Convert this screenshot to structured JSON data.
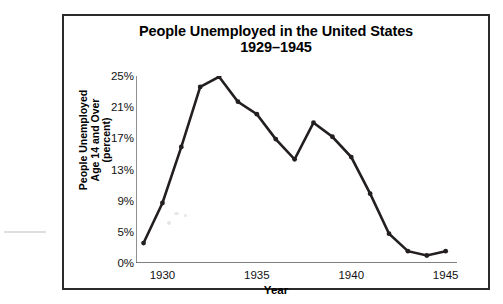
{
  "figure": {
    "title_line1": "People Unemployed in the United States",
    "title_line2": "1929–1945"
  },
  "axes": {
    "y_axis_title": "People Unemployed\nAge 14 and Over\n(percent)",
    "y_axis_title_line1": "People Unemployed",
    "y_axis_title_line2": "Age 14 and Over",
    "y_axis_title_line3": "(percent)",
    "x_axis_title": "Year",
    "y_tick_labels": [
      "25%",
      "21%",
      "17%",
      "13%",
      "9%",
      "5%",
      "0%"
    ],
    "x_tick_labels": [
      "1930",
      "1935",
      "1940",
      "1945"
    ]
  },
  "colors": {
    "line": "#231f20",
    "frame": "#2b2b2b",
    "axis": "#555555",
    "background": "#ffffff"
  },
  "chart_data": {
    "type": "line",
    "title": "People Unemployed in the United States 1929–1945",
    "xlabel": "Year",
    "ylabel": "People Unemployed Age 14 and Over (percent)",
    "x": [
      1929,
      1930,
      1931,
      1932,
      1933,
      1934,
      1935,
      1936,
      1937,
      1938,
      1939,
      1940,
      1941,
      1942,
      1943,
      1944,
      1945
    ],
    "values": [
      3.2,
      8.7,
      15.9,
      23.6,
      24.9,
      21.7,
      20.1,
      16.9,
      14.3,
      19.0,
      17.2,
      14.6,
      9.9,
      4.7,
      1.9,
      1.2,
      1.9
    ],
    "series": [
      {
        "name": "Percent unemployed, age 14 and over",
        "values": [
          3.2,
          8.7,
          15.9,
          23.6,
          24.9,
          21.7,
          20.1,
          16.9,
          14.3,
          19.0,
          17.2,
          14.6,
          9.9,
          4.7,
          1.9,
          1.2,
          1.9
        ]
      }
    ],
    "xlim": [
      1928.6,
      1945.6
    ],
    "ylim": [
      0,
      25
    ],
    "y_ticks": [
      0,
      5,
      9,
      13,
      17,
      21,
      25
    ],
    "x_ticks_major": [
      1930,
      1935,
      1940,
      1945
    ],
    "x_ticks_minor": [
      1929,
      1931,
      1932,
      1933,
      1934,
      1936,
      1937,
      1938,
      1939,
      1941,
      1942,
      1943,
      1944
    ],
    "grid": false,
    "legend": false,
    "markers": true
  }
}
